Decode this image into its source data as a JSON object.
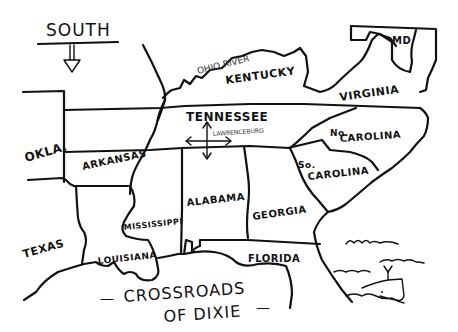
{
  "map": {
    "style": "hand-drawn sketch",
    "ink_color": "#111111",
    "background": "#ffffff"
  },
  "compass": {
    "label": "SOUTH",
    "arrow_direction": "down"
  },
  "labels": {
    "ohio_river": "OHIO RIVER",
    "kentucky": "KENTUCKY",
    "virginia": "VIRGINIA",
    "maryland": "MD",
    "tennessee": "TENNESSEE",
    "lawrenceburg": "LAWRENCEBURG",
    "north_carolina_1": "No.",
    "north_carolina_2": "CAROLINA",
    "south_carolina_1": "So.",
    "south_carolina_2": "CAROLINA",
    "oklahoma": "OKLA.",
    "arkansas": "ARKANSAS",
    "texas": "TEXAS",
    "louisiana": "LOUISIANA",
    "mississippi": "MISSISSIPPI",
    "alabama": "ALABAMA",
    "georgia": "GEORGIA",
    "florida": "FLORIDA"
  },
  "title": {
    "line1": "CROSSROADS",
    "line2": "OF DIXIE",
    "dash_left": "—",
    "dash_right": "—"
  },
  "decorations": {
    "ocean": "waves",
    "creature": "whale"
  }
}
